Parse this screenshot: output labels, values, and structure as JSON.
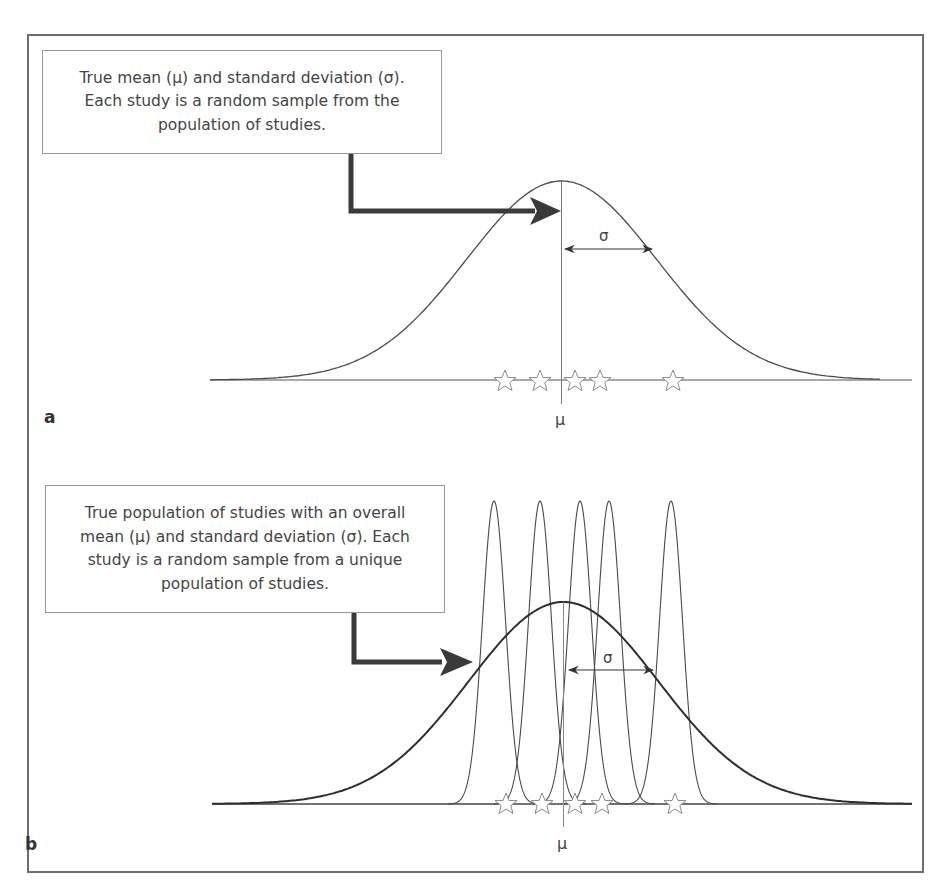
{
  "figure": {
    "panels": [
      {
        "id": "a",
        "label": "a",
        "callout_lines": [
          "True mean (μ) and standard deviation (σ).",
          "Each study is a random sample from the",
          "population of studies."
        ],
        "mean_label": "μ",
        "sigma_label": "σ",
        "study_markers": 5,
        "study_curves": false
      },
      {
        "id": "b",
        "label": "b",
        "callout_lines": [
          "True population of studies with an overall",
          "mean (μ) and standard deviation (σ). Each",
          "study is a random sample from a unique",
          "population of studies."
        ],
        "mean_label": "μ",
        "sigma_label": "σ",
        "study_markers": 5,
        "study_curves": true
      }
    ],
    "marker_icon": "star-outline-icon",
    "colors": {
      "line": "#4a4a4a",
      "arrow": "#3a3a3a",
      "frame": "#6d6d6d",
      "star": "#8a8a8a"
    }
  }
}
